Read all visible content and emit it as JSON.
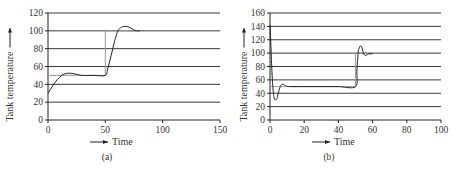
{
  "chart_data": [
    {
      "type": "line",
      "panel_label": "(a)",
      "title": "",
      "xlabel": "Time",
      "ylabel": "Tank temperature",
      "xlim": [
        0,
        150
      ],
      "ylim": [
        0,
        120
      ],
      "xticks": [
        0,
        50,
        100,
        150
      ],
      "yticks": [
        0,
        20,
        40,
        60,
        80,
        100,
        120
      ],
      "grid": "horizontal",
      "setpoint": {
        "name": "Setpoint",
        "x": [
          0,
          50,
          50,
          80
        ],
        "y": [
          50,
          50,
          100,
          100
        ]
      },
      "series": [
        {
          "name": "Tank temperature",
          "x": [
            0,
            3,
            6,
            10,
            14,
            18,
            22,
            26,
            30,
            40,
            50,
            52,
            55,
            58,
            61,
            64,
            67,
            70,
            73,
            76,
            80
          ],
          "y": [
            30,
            36,
            42,
            48,
            51.5,
            52.5,
            52,
            51,
            50,
            50,
            50,
            57,
            72,
            88,
            100,
            104,
            105,
            104.5,
            102.5,
            100.5,
            100
          ]
        }
      ]
    },
    {
      "type": "line",
      "panel_label": "(b)",
      "title": "",
      "xlabel": "Time",
      "ylabel": "Tank temperature",
      "xlim": [
        0,
        100
      ],
      "ylim": [
        0,
        160
      ],
      "xticks": [
        0,
        20,
        40,
        60,
        80,
        100
      ],
      "yticks": [
        0,
        20,
        40,
        60,
        80,
        100,
        120,
        140,
        160
      ],
      "grid": "horizontal",
      "setpoint": {
        "name": "Setpoint",
        "x": [
          0,
          50,
          50,
          60
        ],
        "y": [
          50,
          50,
          100,
          100
        ]
      },
      "series": [
        {
          "name": "Tank temperature",
          "x": [
            0,
            0.4,
            1,
            1.8,
            2.6,
            3.4,
            4.2,
            5,
            6,
            7,
            8,
            9,
            10,
            12,
            20,
            30,
            40,
            50,
            50.8,
            51.5,
            52.2,
            53,
            53.8,
            54.5,
            55.3,
            56,
            57,
            58,
            60
          ],
          "y": [
            142,
            120,
            80,
            45,
            32,
            30,
            33,
            42,
            50,
            53.5,
            53,
            51.5,
            50.5,
            50,
            50,
            50,
            50,
            50,
            75,
            100,
            108,
            111,
            108,
            101,
            97,
            96.5,
            98,
            99,
            99
          ]
        }
      ]
    }
  ]
}
